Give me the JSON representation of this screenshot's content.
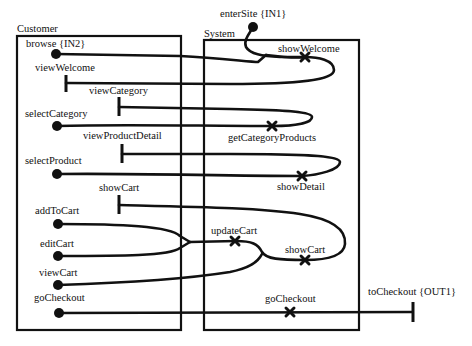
{
  "diagram": {
    "type": "interaction/wiring diagram",
    "boxes": {
      "customer": {
        "label": "Customer"
      },
      "system": {
        "label": "System"
      }
    },
    "ports": {
      "enterSite": "enterSite {IN1}",
      "browse": "browse {IN2}",
      "toCheckout": "toCheckout {OUT1}"
    },
    "customer_labels": {
      "viewWelcome": "viewWelcome",
      "viewCategory": "viewCategory",
      "selectCategory": "selectCategory",
      "viewProductDetail": "viewProductDetail",
      "selectProduct": "selectProduct",
      "showCart": "showCart",
      "addToCart": "addToCart",
      "editCart": "editCart",
      "viewCart": "viewCart",
      "goCheckout": "goCheckout"
    },
    "system_labels": {
      "showWelcome": "showWelcome",
      "getCategoryProducts": "getCategoryProducts",
      "showDetail": "showDetail",
      "updateCart": "updateCart",
      "showCart": "showCart",
      "goCheckout": "goCheckout"
    },
    "colors": {
      "ink": "#111111",
      "background": "#ffffff"
    }
  }
}
